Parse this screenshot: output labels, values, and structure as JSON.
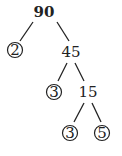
{
  "diagram": {
    "type": "factor-tree",
    "root": "90",
    "nodes": [
      {
        "id": "n90",
        "label": "90",
        "prime": false,
        "bold": true
      },
      {
        "id": "n2",
        "label": "2",
        "prime": true
      },
      {
        "id": "n45",
        "label": "45",
        "prime": false
      },
      {
        "id": "n3a",
        "label": "3",
        "prime": true
      },
      {
        "id": "n15",
        "label": "15",
        "prime": false
      },
      {
        "id": "n3b",
        "label": "3",
        "prime": true
      },
      {
        "id": "n5",
        "label": "5",
        "prime": true
      }
    ],
    "edges": [
      [
        "n90",
        "n2"
      ],
      [
        "n90",
        "n45"
      ],
      [
        "n45",
        "n3a"
      ],
      [
        "n45",
        "n15"
      ],
      [
        "n15",
        "n3b"
      ],
      [
        "n15",
        "n5"
      ]
    ]
  }
}
